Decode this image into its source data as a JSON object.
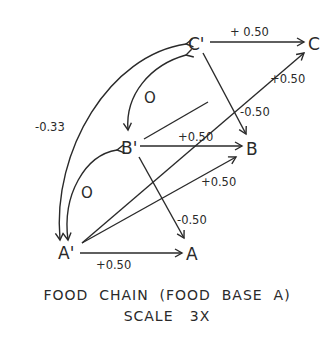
{
  "nodes": {
    "c_prime": "C'",
    "c": "C",
    "b_prime": "B'",
    "b": "B",
    "a_prime": "A'",
    "a": "A"
  },
  "edges": {
    "cprime_to_c": "+ 0.50",
    "aprime_to_c": "+0.50",
    "cprime_to_b": "-0.50",
    "bprime_to_b": "+0.50",
    "aprime_to_b": "+0.50",
    "bprime_to_a": "-0.50",
    "aprime_to_a": "+0.50",
    "cprime_aprime_curve": "-0.33",
    "cprime_bprime_curve": "O",
    "bprime_aprime_curve": "O"
  },
  "caption": {
    "line1": "FOOD  CHAIN  (FOOD  BASE  A)",
    "line2": "SCALE   3X"
  },
  "colors": {
    "ink": "#2a2a2a",
    "background": "#ffffff"
  }
}
